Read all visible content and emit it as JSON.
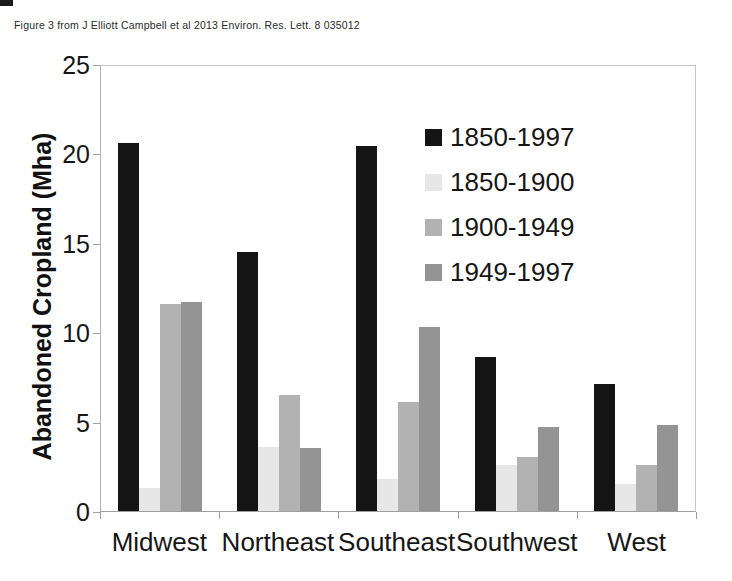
{
  "caption": "Figure 3 from J Elliott Campbell et al 2013 Environ. Res. Lett. 8 035012",
  "chart_data": {
    "type": "bar",
    "title": "",
    "xlabel": "",
    "ylabel": "Abandoned Cropland (Mha)",
    "ylim": [
      0,
      25
    ],
    "yticks": [
      0,
      5,
      10,
      15,
      20,
      25
    ],
    "grid": false,
    "legend_position": "inside-top-right",
    "categories": [
      "Midwest",
      "Northeast",
      "Southeast",
      "Southwest",
      "West"
    ],
    "series": [
      {
        "name": "1850-1997",
        "color": "#141414",
        "values": [
          20.6,
          14.5,
          20.4,
          8.6,
          7.1
        ]
      },
      {
        "name": "1850-1900",
        "color": "#e7e7e7",
        "values": [
          1.3,
          3.6,
          1.8,
          2.6,
          1.5
        ]
      },
      {
        "name": "1900-1949",
        "color": "#b2b2b2",
        "values": [
          11.6,
          6.5,
          6.1,
          3.0,
          2.6
        ]
      },
      {
        "name": "1949-1997",
        "color": "#949494",
        "values": [
          11.7,
          3.5,
          10.3,
          4.7,
          4.8
        ]
      }
    ]
  }
}
